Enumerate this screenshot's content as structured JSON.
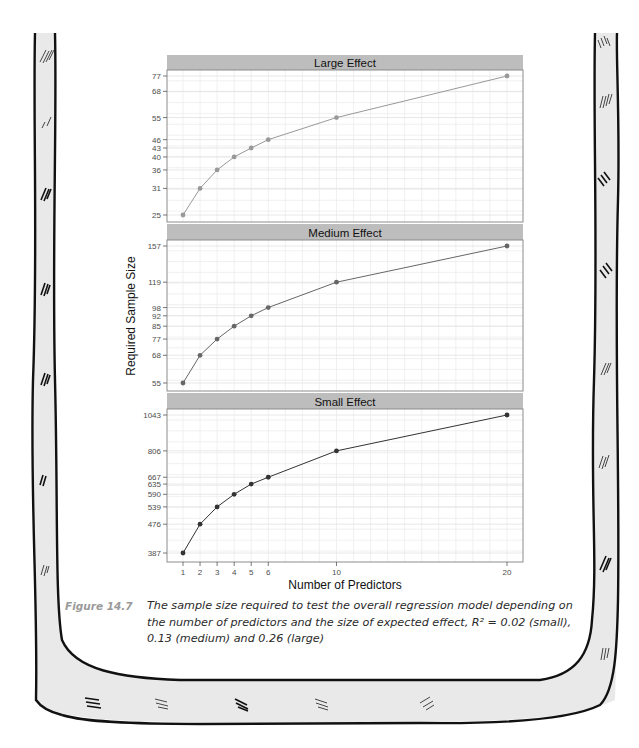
{
  "figure": {
    "label": "Figure 14.7",
    "caption": "The sample size required to test the overall regression model depending on the number of predictors and the size of expected effect, R² = 0.02 (small), 0.13 (medium) and 0.26 (large)"
  },
  "chart_data": {
    "type": "line",
    "layout": "faceted (3 vertically stacked panels, shared x-axis)",
    "xlabel": "Number of Predictors",
    "ylabel": "Required Sample Size",
    "x": [
      1,
      2,
      3,
      4,
      5,
      6,
      10,
      20
    ],
    "x_ticks": [
      1,
      2,
      3,
      4,
      5,
      6,
      10,
      20
    ],
    "grid": true,
    "y_scale": "log",
    "panels": [
      {
        "title": "Large Effect",
        "values": [
          25,
          31,
          36,
          40,
          43,
          46,
          55,
          77
        ],
        "y_ticks": [
          25,
          31,
          36,
          40,
          43,
          46,
          55,
          68,
          77
        ],
        "color": "#999999"
      },
      {
        "title": "Medium Effect",
        "values": [
          55,
          68,
          77,
          85,
          92,
          98,
          119,
          157
        ],
        "y_ticks": [
          55,
          68,
          77,
          85,
          92,
          98,
          119,
          157
        ],
        "color": "#666666"
      },
      {
        "title": "Small Effect",
        "values": [
          387,
          476,
          539,
          590,
          635,
          667,
          806,
          1043
        ],
        "y_ticks": [
          387,
          476,
          539,
          590,
          635,
          667,
          806,
          1043
        ],
        "color": "#333333"
      }
    ]
  },
  "style": {
    "strip_fill": "#bdbdbd",
    "panel_border": "#8c8c8c",
    "grid_color": "#ececec",
    "axis_text": "#4d4d4d",
    "frame_fill": "#e9e9e9",
    "frame_stroke": "#111111"
  }
}
